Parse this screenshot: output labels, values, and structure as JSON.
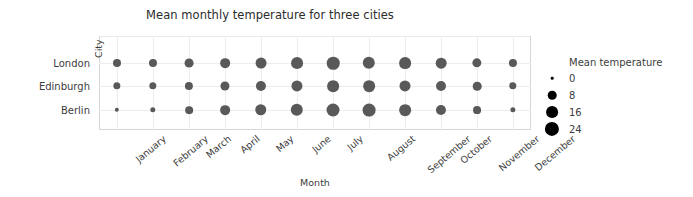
{
  "chart_data": {
    "type": "scatter",
    "title": "Mean monthly temperature for three cities",
    "xlabel": "Month",
    "ylabel": "City",
    "grid": true,
    "legend_position": "right",
    "size_legend": {
      "title": "Mean temperature",
      "entries": [
        {
          "label": "0",
          "value": 0,
          "diameter_px": 2.6
        },
        {
          "label": "8",
          "value": 8,
          "diameter_px": 8.6
        },
        {
          "label": "16",
          "value": 16,
          "diameter_px": 11.8
        },
        {
          "label": "24",
          "value": 24,
          "diameter_px": 14.2
        }
      ]
    },
    "categories": [
      "January",
      "February",
      "March",
      "April",
      "May",
      "June",
      "July",
      "August",
      "September",
      "October",
      "November",
      "December"
    ],
    "rows": [
      "London",
      "Edinburgh",
      "Berlin"
    ],
    "series": [
      {
        "name": "London",
        "values": [
          5.2,
          5.3,
          7.0,
          9.0,
          12.3,
          15.4,
          17.6,
          17.3,
          15.0,
          11.6,
          8.0,
          5.5
        ]
      },
      {
        "name": "Edinburgh",
        "values": [
          4.0,
          4.1,
          5.6,
          7.5,
          10.2,
          13.0,
          14.9,
          14.7,
          12.7,
          9.7,
          6.4,
          4.1
        ]
      },
      {
        "name": "Berlin",
        "values": [
          0.6,
          1.4,
          4.6,
          9.1,
          14.1,
          17.3,
          19.2,
          18.7,
          14.8,
          10.0,
          5.0,
          1.3
        ]
      }
    ],
    "marker_color": "#595959",
    "gridline_color": "#ededed",
    "axis_color": "#d6d6d6"
  }
}
